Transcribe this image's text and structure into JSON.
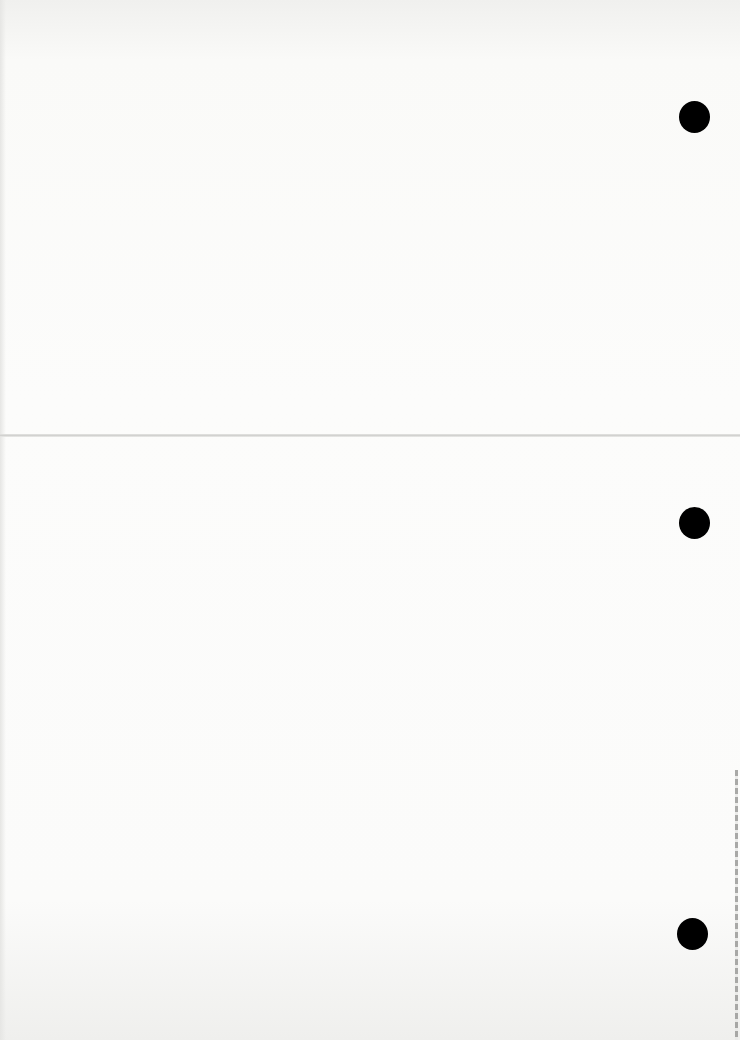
{
  "document": {
    "type": "scanned blank page",
    "visible_text": "",
    "features": {
      "punch_holes": 3,
      "fold_line": true,
      "edge_strip": true
    },
    "colors": {
      "paper": "#fbfbfa",
      "punch_hole": "#000000",
      "fold_line": "#d2d2d0"
    }
  }
}
